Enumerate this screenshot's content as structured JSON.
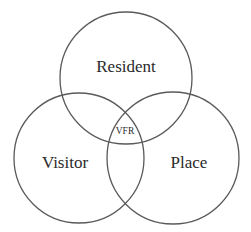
{
  "diagram": {
    "type": "venn",
    "sets": [
      {
        "id": "resident",
        "label": "Resident",
        "cx": 126,
        "cy": 78,
        "r": 66
      },
      {
        "id": "visitor",
        "label": "Visitor",
        "cx": 79,
        "cy": 158,
        "r": 65
      },
      {
        "id": "place",
        "label": "Place",
        "cx": 173,
        "cy": 158,
        "r": 66
      }
    ],
    "intersection_label": "VFR",
    "stroke_color": "#5a5a5a",
    "text_color": "#2a2a2a",
    "background": "#ffffff"
  }
}
